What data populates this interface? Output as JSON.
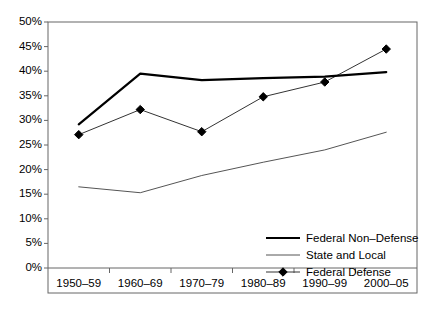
{
  "chart_data": {
    "type": "line",
    "title": "",
    "xlabel": "",
    "ylabel": "",
    "categories": [
      "1950–59",
      "1960–69",
      "1970–79",
      "1980–89",
      "1990–99",
      "2000–05"
    ],
    "ylim": [
      0,
      50
    ],
    "ytick_labels": [
      "0%",
      "5%",
      "10%",
      "15%",
      "20%",
      "25%",
      "30%",
      "35%",
      "40%",
      "45%",
      "50%"
    ],
    "ytick_values": [
      0,
      5,
      10,
      15,
      20,
      25,
      30,
      35,
      40,
      45,
      50
    ],
    "grid": false,
    "legend_position": "inside-bottom-right",
    "series": [
      {
        "name": "Federal Non–Defense",
        "values": [
          29.2,
          39.5,
          38.2,
          38.6,
          38.9,
          39.8
        ],
        "color": "#000000",
        "line_width": 2.2,
        "marker": "none"
      },
      {
        "name": "State and Local",
        "values": [
          16.5,
          15.3,
          18.8,
          21.5,
          24.0,
          27.6
        ],
        "color": "#555555",
        "line_width": 1.0,
        "marker": "none"
      },
      {
        "name": "Federal Defense",
        "values": [
          27.1,
          32.2,
          27.7,
          34.8,
          37.8,
          44.5
        ],
        "color": "#333333",
        "line_width": 1.0,
        "marker": "diamond"
      }
    ]
  },
  "legend": {
    "items": [
      {
        "label": "Federal Non–Defense"
      },
      {
        "label": "State and Local"
      },
      {
        "label": "Federal Defense"
      }
    ]
  }
}
